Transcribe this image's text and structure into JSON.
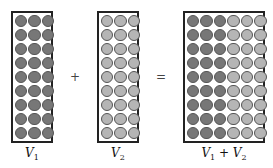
{
  "diagram": {
    "colors": {
      "dark": "#777777",
      "light": "#b5b5b5",
      "border": "#222222"
    },
    "boxes": [
      {
        "id": "v1",
        "label_var": "V",
        "label_sub": "1",
        "rows": 9,
        "cols": 3,
        "fill": [
          "dark",
          "dark",
          "dark"
        ]
      },
      {
        "id": "v2",
        "label_var": "V",
        "label_sub": "2",
        "rows": 9,
        "cols": 3,
        "fill": [
          "light",
          "light",
          "light"
        ]
      },
      {
        "id": "v1v2",
        "label_var": "V",
        "label_sub": "1",
        "label_op": "+",
        "label_var2": "V",
        "label_sub2": "2",
        "rows": 9,
        "cols": 6,
        "fill": [
          "dark",
          "dark",
          "dark",
          "light",
          "light",
          "light"
        ]
      }
    ],
    "operators": {
      "plus": "+",
      "equals": "="
    }
  }
}
